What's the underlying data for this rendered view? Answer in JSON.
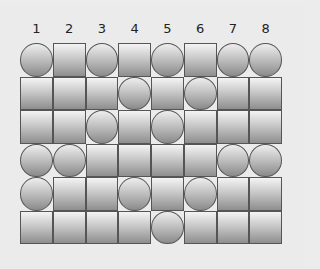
{
  "columns": [
    "1",
    "2",
    "3",
    "4",
    "5",
    "6",
    "7",
    "8"
  ],
  "legend": {
    "C": "circle",
    "S": "square"
  },
  "grid": [
    [
      "C",
      "S",
      "C",
      "S",
      "C",
      "S",
      "C",
      "C"
    ],
    [
      "S",
      "S",
      "S",
      "C",
      "S",
      "C",
      "S",
      "S"
    ],
    [
      "S",
      "S",
      "C",
      "S",
      "C",
      "S",
      "S",
      "S"
    ],
    [
      "C",
      "C",
      "S",
      "S",
      "S",
      "S",
      "C",
      "C"
    ],
    [
      "C",
      "S",
      "S",
      "C",
      "S",
      "C",
      "S",
      "S"
    ],
    [
      "S",
      "S",
      "S",
      "S",
      "C",
      "S",
      "S",
      "S"
    ]
  ],
  "colors": {
    "background": "#ebebeb",
    "tile_border": "#555555",
    "tile_light": "#f4f4f4",
    "tile_dark": "#8e8e8e"
  }
}
